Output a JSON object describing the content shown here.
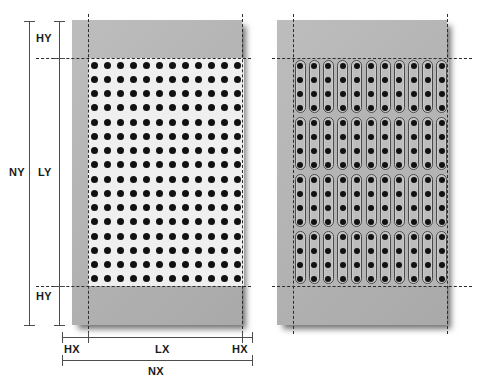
{
  "figure": {
    "background_color": "#ffffff",
    "plate_color": "#b4b4b4",
    "hole_color": "#111111",
    "field_color_left": "#efefef",
    "annotation_color": "#4d4d4d",
    "dashed_color": "#2b2b2b"
  },
  "labels": {
    "ny": "NY",
    "ly": "LY",
    "hy_top": "HY",
    "hy_bottom": "HY",
    "nx": "NX",
    "lx": "LX",
    "hx_left": "HX",
    "hx_right": "HX"
  },
  "panels": [
    {
      "id": "left-panel",
      "name": "round-hole-pattern-plate",
      "pattern": "round-holes-grid",
      "columns": 12,
      "rows": 16,
      "hole_shape": "circle",
      "hole_diameter_px": 7,
      "pitch_x_px": 13,
      "pitch_y_px": 13.8,
      "field_background": "#efefef",
      "margin_label_x": "HX",
      "margin_label_y": "HY"
    },
    {
      "id": "right-panel",
      "name": "slotted-hole-pattern-plate",
      "pattern": "slotted-columns-with-holes",
      "columns": 11,
      "row_groups": 4,
      "holes_per_slot": 4,
      "rows": 16,
      "hole_shape": "circle-in-slot",
      "hole_diameter_px": 6,
      "slot_width_px": 11,
      "pitch_x_px": 13.1,
      "pitch_y_px": 13.5,
      "field_background": "#b4b4b4",
      "margin_label_x": "HX",
      "margin_label_y": "HY"
    }
  ],
  "dimensions": {
    "vertical": [
      {
        "key": "NY",
        "label": "NY",
        "spans": "overall plate height"
      },
      {
        "key": "HY",
        "label": "HY",
        "spans": "top unperforated margin"
      },
      {
        "key": "LY",
        "label": "LY",
        "spans": "perforated field height"
      },
      {
        "key": "HY2",
        "label": "HY",
        "spans": "bottom unperforated margin"
      }
    ],
    "horizontal": [
      {
        "key": "HX",
        "label": "HX",
        "spans": "left unperforated margin"
      },
      {
        "key": "LX",
        "label": "LX",
        "spans": "perforated field width"
      },
      {
        "key": "HX2",
        "label": "HX",
        "spans": "right unperforated margin"
      },
      {
        "key": "NX",
        "label": "NX",
        "spans": "overall plate width"
      }
    ]
  }
}
